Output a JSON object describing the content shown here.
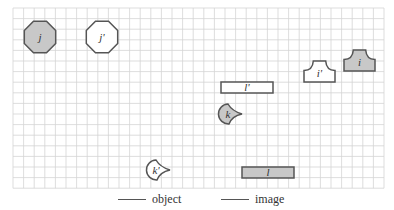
{
  "grid": {
    "left": 13,
    "top": 8,
    "cols": 35,
    "rows": 17,
    "cell": 10.6,
    "line_color": "#d4d4d4",
    "border_color": "#cfcfcf"
  },
  "colors": {
    "image_fill": "#c8c8c8",
    "object_fill": "#ffffff",
    "stroke": "#555555",
    "text": "#333333"
  },
  "shapes": [
    {
      "id": "j",
      "label": "j",
      "kind": "octagon",
      "role": "image",
      "cx": 40,
      "cy": 37,
      "r": 17
    },
    {
      "id": "j_prime",
      "label": "j'",
      "kind": "octagon",
      "role": "object",
      "cx": 102,
      "cy": 37,
      "r": 17
    },
    {
      "id": "i_prime",
      "label": "i'",
      "kind": "arch",
      "role": "object",
      "x": 304,
      "y": 61,
      "w": 31,
      "h": 21
    },
    {
      "id": "i",
      "label": "i",
      "kind": "arch",
      "role": "image",
      "x": 344,
      "y": 50,
      "w": 31,
      "h": 21
    },
    {
      "id": "l_prime",
      "label": "l'",
      "kind": "rect",
      "role": "object",
      "x": 221,
      "y": 82,
      "w": 52,
      "h": 11
    },
    {
      "id": "k",
      "label": "k",
      "kind": "claw",
      "role": "image",
      "cx": 230,
      "cy": 114,
      "r": 10
    },
    {
      "id": "k_prime",
      "label": "k'",
      "kind": "claw",
      "role": "object",
      "cx": 158,
      "cy": 170,
      "r": 10
    },
    {
      "id": "l",
      "label": "l",
      "kind": "rect",
      "role": "image",
      "x": 242,
      "y": 167,
      "w": 52,
      "h": 11
    }
  ],
  "legend": {
    "object_label": "object",
    "image_label": "image"
  }
}
